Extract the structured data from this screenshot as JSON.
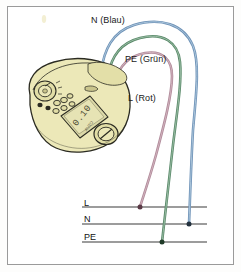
{
  "diagram": {
    "background_color": "#ffffff",
    "frame_color": "#9a9a9a",
    "wire_labels": [
      {
        "id": "n",
        "text": "N (Blau)",
        "color": "#6f93b8",
        "conductor": "N",
        "terminal": "N"
      },
      {
        "id": "pe",
        "text": "PE (Grün)",
        "color": "#5a8a6a",
        "conductor": "PE",
        "terminal": "PE"
      },
      {
        "id": "l",
        "text": "L (Rot)",
        "color": "#b08a9a",
        "conductor": "L",
        "terminal": "L"
      }
    ],
    "bus_lines": [
      {
        "id": "l",
        "label": "L",
        "y": 207
      },
      {
        "id": "n",
        "label": "N",
        "y": 224
      },
      {
        "id": "pe",
        "label": "PE",
        "y": 242
      }
    ],
    "connection_dots": [
      {
        "bus": "L",
        "wire": "L (Rot)",
        "x": 140,
        "y": 207
      },
      {
        "bus": "N",
        "wire": "N (Blau)",
        "x": 189,
        "y": 224
      },
      {
        "bus": "PE",
        "wire": "PE (Grün)",
        "x": 162,
        "y": 242
      }
    ],
    "device": {
      "name": "Installationstester",
      "body_color": "#ece8b8",
      "display_color": "#dcd9a8",
      "outline_color": "#2b2b22",
      "display_reading": "0.10",
      "controls": [
        "rotary-selector-dial",
        "keypad-buttons",
        "lcd-display",
        "range-knob"
      ],
      "sockets": [
        {
          "id": "socket-blue",
          "color": "#7ba6cc",
          "conductor": "N"
        },
        {
          "id": "socket-green",
          "color": "#6fa87e",
          "conductor": "PE"
        },
        {
          "id": "socket-red",
          "color": "#d39aa8",
          "conductor": "L"
        }
      ]
    }
  }
}
